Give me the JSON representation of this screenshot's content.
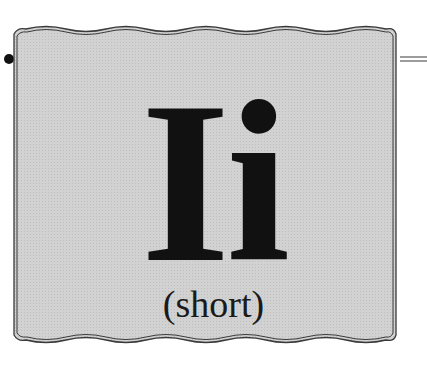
{
  "card": {
    "letters": "Ii",
    "caption": "(short)",
    "background_color": "#cfcfcf",
    "border_color": "#3a3a3a",
    "text_color": "#111111"
  }
}
